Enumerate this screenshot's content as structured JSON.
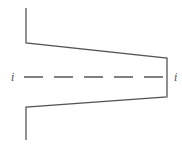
{
  "diagram": {
    "stroke_color": "#555555",
    "labels": {
      "left": "i",
      "right": "i"
    },
    "outline_points": [
      [
        26,
        8
      ],
      [
        26,
        43
      ],
      [
        167,
        58
      ],
      [
        167,
        97
      ],
      [
        26,
        107
      ],
      [
        26,
        140
      ]
    ],
    "centerline": {
      "x1": 24,
      "x2": 167,
      "y": 77,
      "dash": "19 11"
    }
  }
}
